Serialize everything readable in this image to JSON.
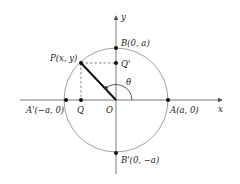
{
  "diagram": {
    "axes": {
      "x_label": "x",
      "y_label": "y"
    },
    "points": {
      "P": "P(x, y)",
      "Q": "Q",
      "Q_prime": "Q'",
      "O": "O",
      "A": "A(a, 0)",
      "A_prime": "A'(−a, 0)",
      "B": "B(0, a)",
      "B_prime": "B'(0, −a)"
    },
    "angle_label": "θ",
    "colors": {
      "radius": "#111111",
      "circle": "#888888",
      "axis": "#555555"
    }
  }
}
